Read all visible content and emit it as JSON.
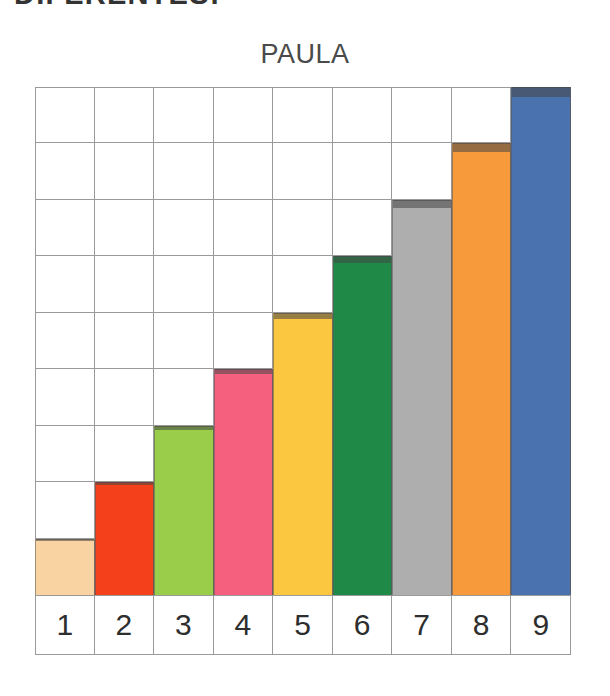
{
  "heading": {
    "text": "DIFERENTES:"
  },
  "chart_data": {
    "type": "bar",
    "title": "PAULA",
    "xlabel": "",
    "ylabel": "",
    "categories": [
      "1",
      "2",
      "3",
      "4",
      "5",
      "6",
      "7",
      "8",
      "9"
    ],
    "values": [
      1,
      2,
      3,
      4,
      5,
      6,
      7,
      8,
      9
    ],
    "ylim": [
      0,
      9
    ],
    "grid": true,
    "legend": "none",
    "grid_rows": 9,
    "grid_cols": 9,
    "grid_line_color": "#9a9a9a",
    "bar_colors": [
      "#f9d3a1",
      "#f4411b",
      "#9ace4a",
      "#f4607e",
      "#fbc640",
      "#1f8a48",
      "#aeaeae",
      "#f79a3c",
      "#4a72ae"
    ],
    "bar_color_names": [
      "light-peach",
      "red-orange",
      "yellow-green",
      "pink",
      "golden-yellow",
      "green",
      "gray",
      "orange",
      "blue"
    ]
  }
}
